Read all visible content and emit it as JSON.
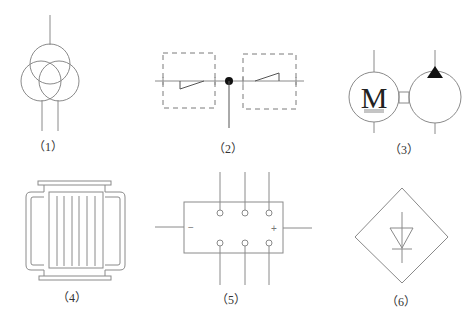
{
  "figure": {
    "symbols": [
      {
        "id": 1,
        "label": "（1）",
        "name": "three-winding-transformer"
      },
      {
        "id": 2,
        "label": "（2）",
        "name": "disconnector-pair-with-dashed-enclosures"
      },
      {
        "id": 3,
        "label": "（3）",
        "name": "motor-pump-unit",
        "motor_letter": "M"
      },
      {
        "id": 4,
        "label": "（4）",
        "name": "transformer-core-winding"
      },
      {
        "id": 5,
        "label": "（5）",
        "name": "rectifier-bridge-module",
        "neg_sign": "−",
        "pos_sign": "+"
      },
      {
        "id": 6,
        "label": "（6）",
        "name": "rectifier-diode-unit"
      }
    ]
  },
  "colors": {
    "line": "#8a8a8a",
    "fill_dark": "#111111",
    "background": "#ffffff"
  }
}
